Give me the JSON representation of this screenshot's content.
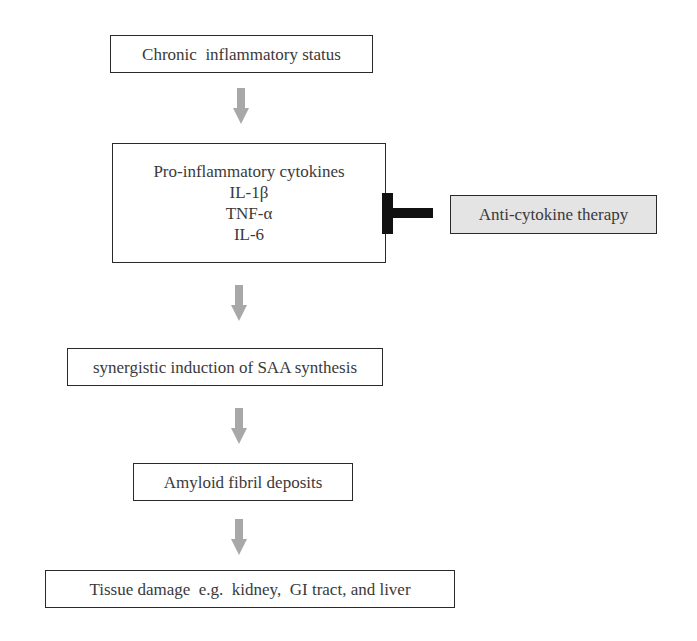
{
  "diagram": {
    "nodes": [
      {
        "id": "chronic",
        "label": "Chronic  inflammatory status"
      },
      {
        "id": "cytokines",
        "lines": [
          "Pro-inflammatory cytokines",
          "IL-1β",
          "TNF-α",
          "IL-6"
        ]
      },
      {
        "id": "saa",
        "label": "synergistic induction of SAA synthesis"
      },
      {
        "id": "amyloid",
        "label": "Amyloid fibril deposits"
      },
      {
        "id": "tissue",
        "label": "Tissue damage  e.g.  kidney,  GI tract, and liver"
      }
    ],
    "inhibitor": {
      "id": "therapy",
      "label": "Anti-cytokine therapy"
    },
    "edges": [
      {
        "from": "chronic",
        "to": "cytokines",
        "type": "arrow"
      },
      {
        "from": "cytokines",
        "to": "saa",
        "type": "arrow"
      },
      {
        "from": "saa",
        "to": "amyloid",
        "type": "arrow"
      },
      {
        "from": "amyloid",
        "to": "tissue",
        "type": "arrow"
      },
      {
        "from": "therapy",
        "to": "cytokines",
        "type": "inhibition"
      }
    ],
    "colors": {
      "arrow": "#a8a8a8",
      "border": "#2a2a2a",
      "inhibitor_bar": "#111111",
      "therapy_fill": "#e4e4e4"
    }
  }
}
